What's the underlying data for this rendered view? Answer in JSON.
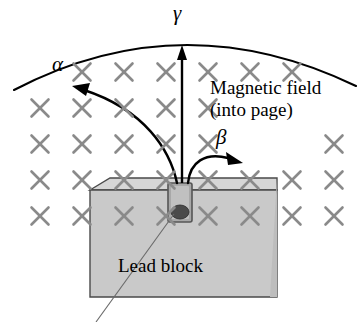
{
  "figure": {
    "kind": "physics-diagram"
  },
  "labels": {
    "alpha": "α",
    "beta": "β",
    "gamma": "γ",
    "field_line1": "Magnetic field",
    "field_line2": "(into page)",
    "block": "Lead block"
  },
  "icons": {
    "field_mark": "×",
    "alpha_ray": "alpha-ray-arrow",
    "beta_ray": "beta-ray-arrow",
    "gamma_ray": "gamma-ray-arrow",
    "detector_arc": "detector-arc",
    "source": "radioactive-source",
    "cavity": "source-cavity",
    "leader": "leader-line"
  },
  "colors": {
    "ink": "#000000",
    "field_mark": "#8a8a8a",
    "block_face": "#c9c9c9",
    "block_top": "#d6d6d6",
    "block_edge": "#4a4a4a",
    "cavity_fill": "#a8a8a8",
    "source_fill": "#4a4a4a",
    "background": "#ffffff"
  },
  "chart_data": {
    "type": "scatter",
    "xlabel": "",
    "ylabel": "",
    "field_marks": {
      "symbol": "×",
      "rows": [
        {
          "y": 72,
          "xs": [
            82,
            124,
            166,
            208,
            250,
            292
          ]
        },
        {
          "y": 108,
          "xs": [
            40,
            82,
            124,
            166,
            208
          ]
        },
        {
          "y": 144,
          "xs": [
            40,
            82,
            124,
            166,
            208,
            334
          ]
        },
        {
          "y": 180,
          "xs": [
            40,
            82,
            124,
            166,
            208,
            250,
            292,
            334
          ]
        },
        {
          "y": 216,
          "xs": [
            40,
            82,
            124,
            166,
            208,
            250,
            292,
            334
          ]
        }
      ]
    },
    "rays": [
      {
        "name": "alpha",
        "label": "α",
        "direction": "curves-left",
        "label_x": 59,
        "label_y": 63
      },
      {
        "name": "gamma",
        "label": "γ",
        "direction": "straight-up",
        "label_x": 178,
        "label_y": 13
      },
      {
        "name": "beta",
        "label": "β",
        "direction": "curves-right",
        "label_x": 222,
        "label_y": 136
      }
    ],
    "annotations": [
      {
        "text": "Magnetic field",
        "x": 212,
        "y": 88
      },
      {
        "text": "(into page)",
        "x": 212,
        "y": 110
      },
      {
        "text": "Lead block",
        "x": 120,
        "y": 268
      }
    ]
  }
}
